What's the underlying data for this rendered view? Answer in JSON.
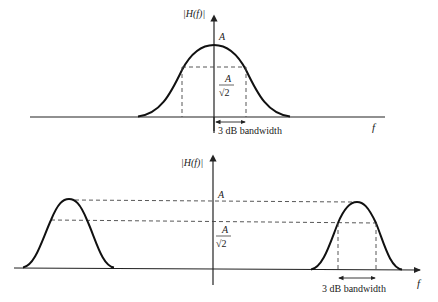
{
  "figure": {
    "top": {
      "y_label": "|H(f)|",
      "x_label": "f",
      "peak_label": "A",
      "half_power_label_num": "A",
      "half_power_label_den": "√2",
      "bandwidth_label": "3 dB bandwidth",
      "description": "Lowpass (baseband) magnitude response"
    },
    "bottom": {
      "y_label": "|H(f)|",
      "x_label": "f",
      "peak_label": "A",
      "half_power_label_num": "A",
      "half_power_label_den": "√2",
      "bandwidth_label": "3 dB bandwidth",
      "description": "Bandpass magnitude response"
    }
  },
  "colors": {
    "curve": "#111111",
    "axis": "#222222",
    "dashed": "#444444",
    "text": "#1a1a1a"
  }
}
